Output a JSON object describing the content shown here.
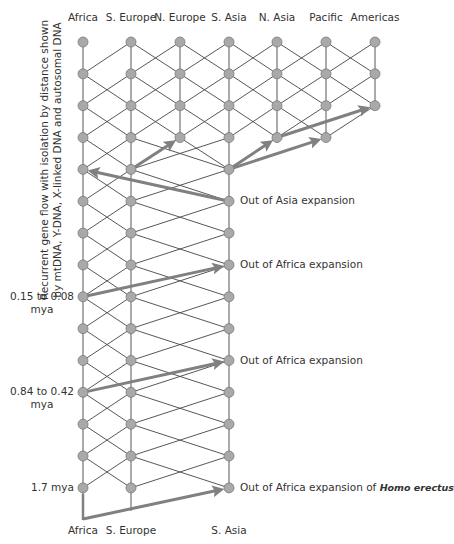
{
  "columns": [
    {
      "id": "africa",
      "label": "Africa",
      "x": 83
    },
    {
      "id": "s_europe",
      "label": "S. Europe",
      "x": 131
    },
    {
      "id": "n_europe",
      "label": "N. Europe",
      "x": 180
    },
    {
      "id": "s_asia",
      "label": "S. Asia",
      "x": 229
    },
    {
      "id": "n_asia",
      "label": "N. Asia",
      "x": 277
    },
    {
      "id": "pacific",
      "label": "Pacific",
      "x": 326
    },
    {
      "id": "americas",
      "label": "Americas",
      "x": 375
    }
  ],
  "bottom_labels": [
    {
      "label": "Africa",
      "x": 83
    },
    {
      "label": "S. Europe",
      "x": 131
    },
    {
      "label": "S. Asia",
      "x": 229
    }
  ],
  "rows": {
    "top_y": 42,
    "spacing": 31.85,
    "count": 15
  },
  "column_depth": {
    "africa": 15,
    "s_europe": 15,
    "n_europe": 4,
    "s_asia": 15,
    "n_asia": 4,
    "pacific": 4,
    "americas": 3
  },
  "side_label": {
    "line1": "Recurrent gene flow with isolation by distance shown",
    "line2": "by mtDNA, Y-DNA, X-linked DNA and autosomal DNA"
  },
  "time_labels": [
    {
      "line1": "0.15 to 0.08",
      "line2": "mya",
      "row": 8
    },
    {
      "line1": "0.84 to 0.42",
      "line2": "mya",
      "row": 11
    },
    {
      "line1": "1.7 mya",
      "line2": "",
      "row": 14
    }
  ],
  "events": [
    {
      "text": "Out of Asia expansion",
      "italic": "",
      "row": 5
    },
    {
      "text": "Out of Africa expansion",
      "italic": "",
      "row": 7
    },
    {
      "text": "Out of Africa expansion",
      "italic": "",
      "row": 10
    },
    {
      "text": "Out of Africa expansion of ",
      "italic": "Homo erectus",
      "row": 14
    }
  ],
  "arrows": [
    {
      "name": "out-of-asia-to-africa",
      "from": [
        "s_asia",
        5
      ],
      "to": [
        "africa",
        4
      ]
    },
    {
      "name": "s-europe-to-n-europe",
      "from": [
        "s_europe",
        4
      ],
      "to": [
        "n_europe",
        3
      ]
    },
    {
      "name": "s-asia-to-n-asia",
      "from": [
        "s_asia",
        4
      ],
      "to": [
        "n_asia",
        3
      ]
    },
    {
      "name": "s-asia-to-pacific",
      "from": [
        "s_asia",
        4
      ],
      "to": [
        "pacific",
        3
      ]
    },
    {
      "name": "n-asia-to-americas",
      "from": [
        "n_asia",
        3
      ],
      "to": [
        "americas",
        2
      ]
    },
    {
      "name": "out-of-africa-recent",
      "from": [
        "africa",
        8
      ],
      "to": [
        "s_asia",
        7
      ]
    },
    {
      "name": "out-of-africa-middle",
      "from": [
        "africa",
        11
      ],
      "to": [
        "s_asia",
        10
      ]
    },
    {
      "name": "out-of-africa-homo-erectus",
      "from": [
        "africa_base",
        0
      ],
      "to": [
        "s_asia",
        14
      ]
    }
  ],
  "colors": {
    "node_fill": "#a9a9a9",
    "node_stroke": "#7a7a7a",
    "line": "#444444",
    "arrow": "#808080",
    "text": "#333333"
  }
}
